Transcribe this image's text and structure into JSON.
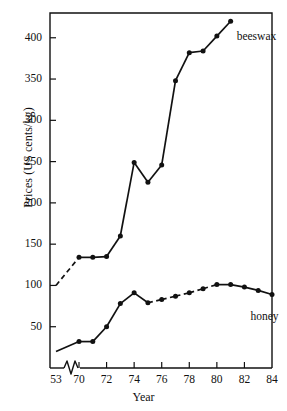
{
  "chart_data": {
    "type": "line",
    "title": "",
    "xlabel": "Year",
    "ylabel": "Prices (US cents/kg)",
    "xlim": [
      1969,
      1984
    ],
    "ylim": [
      0,
      430
    ],
    "grid": false,
    "legend_position": "inline-annotation",
    "axis_break": {
      "present": true,
      "between": [
        1953,
        1970
      ],
      "symbol": "zigzag"
    },
    "x_tick_labels": [
      "53",
      "70",
      "72",
      "74",
      "76",
      "78",
      "80",
      "82",
      "84"
    ],
    "x_tick_values": [
      1953,
      1970,
      1972,
      1974,
      1976,
      1978,
      1980,
      1982,
      1984
    ],
    "y_tick_labels": [
      "50",
      "100",
      "150",
      "200",
      "250",
      "300",
      "350",
      "400"
    ],
    "y_tick_values": [
      50,
      100,
      150,
      200,
      250,
      300,
      350,
      400
    ],
    "series": [
      {
        "name": "beeswax",
        "label": "beeswax",
        "color": "#111111",
        "marker": "filled-circle",
        "x": [
          1953,
          1970,
          1971,
          1972,
          1973,
          1974,
          1975,
          1976,
          1977,
          1978,
          1979,
          1980,
          1981
        ],
        "values": [
          100,
          134,
          134,
          135,
          160,
          249,
          225,
          246,
          348,
          382,
          384,
          402,
          420
        ],
        "dashed_from": 1953,
        "dashed_to": 1970
      },
      {
        "name": "honey",
        "label": "honey",
        "color": "#111111",
        "marker": "filled-circle",
        "x": [
          1953,
          1970,
          1971,
          1972,
          1973,
          1974,
          1975,
          1976,
          1977,
          1978,
          1979,
          1980,
          1981,
          1982,
          1983,
          1984
        ],
        "values": [
          20,
          32,
          32,
          50,
          78,
          91,
          79,
          83,
          87,
          91,
          96,
          101,
          101,
          98,
          94,
          89
        ],
        "dashed_from": 1975,
        "dashed_to": 1980
      }
    ],
    "annotations": [
      {
        "text": "beeswax",
        "x": 1981,
        "y": 400
      },
      {
        "text": "honey",
        "x": 1982,
        "y": 60
      }
    ]
  }
}
